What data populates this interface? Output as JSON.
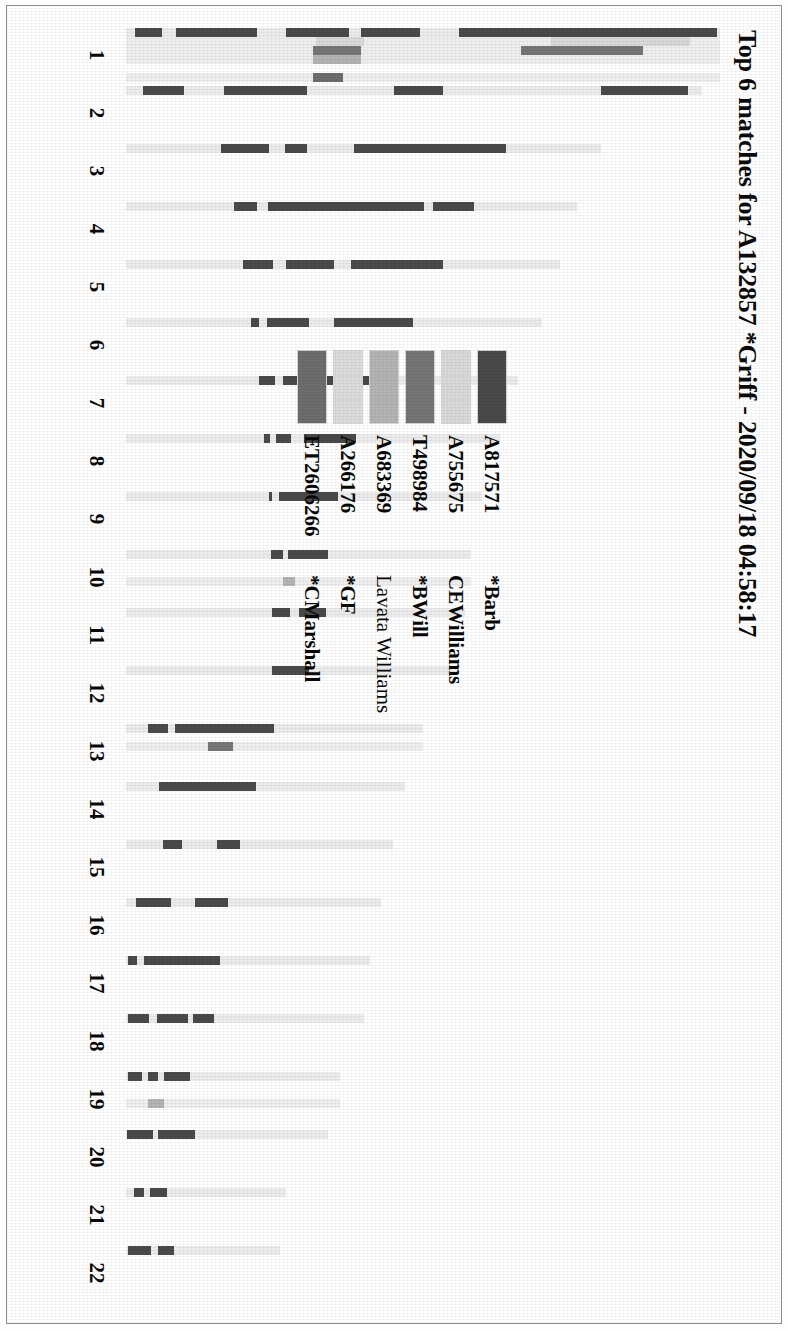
{
  "document": {
    "type": "chromosome-match-map",
    "title": "Top 6 matches for A132857 *Griff - 2020/09/18 04:58:17"
  },
  "legend": {
    "rows": [
      {
        "kit": "A817571",
        "name": "*Barb",
        "color": "#4a4a4a"
      },
      {
        "kit": "A755675",
        "name": "CEWilliams",
        "color": "#d9d9d9"
      },
      {
        "kit": "T498984",
        "name": "*BWill",
        "color": "#767676"
      },
      {
        "kit": "A683369",
        "name": "Lavata Williams",
        "color": "#b4b4b4"
      },
      {
        "kit": "A266176",
        "name": "*GF",
        "color": "#dcdcdc"
      },
      {
        "kit": "ET2606266",
        "name": "*CMarshall",
        "color": "#6d6d6d"
      }
    ]
  },
  "chart_data": {
    "type": "bar",
    "title": "Top 6 matches for A132857 *Griff - 2020/09/18 04:58:17",
    "subtitle": "",
    "xlabel": "Chromosome",
    "ylabel": "",
    "grid": false,
    "legend_position": "center",
    "orientation": "vertical-chromosome-painting",
    "categories": [
      "1",
      "2",
      "3",
      "4",
      "5",
      "6",
      "7",
      "8",
      "9",
      "10",
      "11",
      "12",
      "13",
      "14",
      "15",
      "16",
      "17",
      "18",
      "19",
      "20",
      "21",
      "22"
    ],
    "series": [
      {
        "name": "*Barb",
        "kit": "A817571",
        "color": "#4a4a4a"
      },
      {
        "name": "CEWilliams",
        "kit": "A755675",
        "color": "#d9d9d9"
      },
      {
        "name": "*BWill",
        "kit": "T498984",
        "color": "#767676"
      },
      {
        "name": "Lavata Williams",
        "kit": "A683369",
        "color": "#b4b4b4"
      },
      {
        "name": "*GF",
        "kit": "A266176",
        "color": "#dcdcdc"
      },
      {
        "name": "*CMarshall",
        "kit": "ET2606266",
        "color": "#6d6d6d"
      }
    ],
    "chromosomes": [
      {
        "name": "1",
        "length": 100,
        "lanes": [
          {
            "series": 0,
            "segments": [
              [
                0.5,
                44.0
              ],
              [
                50.5,
                60.5
              ],
              [
                62.5,
                73.0
              ],
              [
                78.0,
                91.5
              ],
              [
                94.0,
                98.5
              ]
            ]
          },
          {
            "series": 1,
            "segments": [
              [
                5.0,
                28.5
              ],
              [
                60.0,
                68.0
              ]
            ]
          },
          {
            "series": 2,
            "segments": [
              [
                13.0,
                33.5
              ],
              [
                60.5,
                68.5
              ]
            ]
          },
          {
            "series": 3,
            "segments": [
              [
                60.5,
                68.5
              ]
            ]
          },
          {
            "series": 4,
            "segments": []
          },
          {
            "series": 5,
            "segments": [
              [
                63.5,
                68.5
              ]
            ]
          }
        ]
      },
      {
        "name": "2",
        "length": 97,
        "lanes": [
          {
            "series": 0,
            "segments": [
              [
                2.5,
                17.5
              ],
              [
                45.0,
                53.5
              ],
              [
                68.5,
                83.0
              ],
              [
                90.0,
                97.0
              ]
            ]
          },
          {
            "series": 1,
            "segments": []
          },
          {
            "series": 2,
            "segments": []
          },
          {
            "series": 3,
            "segments": []
          },
          {
            "series": 4,
            "segments": []
          },
          {
            "series": 5,
            "segments": []
          }
        ]
      },
      {
        "name": "3",
        "length": 80,
        "lanes": [
          {
            "series": 0,
            "segments": [
              [
                20.0,
                52.0
              ],
              [
                62.0,
                66.5
              ],
              [
                70.0,
                80.0
              ]
            ]
          },
          {
            "series": 1,
            "segments": []
          },
          {
            "series": 2,
            "segments": []
          },
          {
            "series": 3,
            "segments": []
          },
          {
            "series": 4,
            "segments": []
          },
          {
            "series": 5,
            "segments": []
          }
        ]
      },
      {
        "name": "4",
        "length": 76,
        "lanes": [
          {
            "series": 0,
            "segments": [
              [
                23.0,
                32.0
              ],
              [
                34.0,
                68.5
              ],
              [
                71.0,
                76.0
              ]
            ]
          },
          {
            "series": 1,
            "segments": []
          },
          {
            "series": 2,
            "segments": []
          },
          {
            "series": 3,
            "segments": []
          },
          {
            "series": 4,
            "segments": []
          },
          {
            "series": 5,
            "segments": []
          }
        ]
      },
      {
        "name": "5",
        "length": 73,
        "lanes": [
          {
            "series": 0,
            "segments": [
              [
                27.0,
                48.0
              ],
              [
                52.0,
                63.0
              ],
              [
                66.0,
                73.0
              ]
            ]
          },
          {
            "series": 1,
            "segments": []
          },
          {
            "series": 2,
            "segments": []
          },
          {
            "series": 3,
            "segments": []
          },
          {
            "series": 4,
            "segments": []
          },
          {
            "series": 5,
            "segments": []
          }
        ]
      },
      {
        "name": "6",
        "length": 70,
        "lanes": [
          {
            "series": 0,
            "segments": [
              [
                31.0,
                50.0
              ],
              [
                56.0,
                66.0
              ],
              [
                68.0,
                70.0
              ]
            ]
          },
          {
            "series": 1,
            "segments": []
          },
          {
            "series": 2,
            "segments": []
          },
          {
            "series": 3,
            "segments": []
          },
          {
            "series": 4,
            "segments": []
          },
          {
            "series": 5,
            "segments": []
          }
        ]
      },
      {
        "name": "7",
        "length": 66,
        "lanes": [
          {
            "series": 0,
            "segments": [
              [
                36.5,
                60.0
              ],
              [
                62.0,
                66.0
              ]
            ]
          },
          {
            "series": 1,
            "segments": []
          },
          {
            "series": 2,
            "segments": []
          },
          {
            "series": 3,
            "segments": []
          },
          {
            "series": 4,
            "segments": []
          },
          {
            "series": 5,
            "segments": []
          }
        ]
      },
      {
        "name": "8",
        "length": 63,
        "lanes": [
          {
            "series": 0,
            "segments": [
              [
                38.5,
                52.5
              ],
              [
                56.0,
                60.0
              ],
              [
                61.5,
                63.0
              ]
            ]
          },
          {
            "series": 1,
            "segments": []
          },
          {
            "series": 2,
            "segments": []
          },
          {
            "series": 3,
            "segments": []
          },
          {
            "series": 4,
            "segments": []
          },
          {
            "series": 5,
            "segments": []
          }
        ]
      },
      {
        "name": "9",
        "length": 60,
        "lanes": [
          {
            "series": 0,
            "segments": [
              [
                40.5,
                57.0
              ],
              [
                59.0,
                60.0
              ]
            ]
          },
          {
            "series": 1,
            "segments": []
          },
          {
            "series": 2,
            "segments": []
          },
          {
            "series": 3,
            "segments": []
          },
          {
            "series": 4,
            "segments": []
          },
          {
            "series": 5,
            "segments": []
          }
        ]
      },
      {
        "name": "10",
        "length": 58,
        "lanes": [
          {
            "series": 0,
            "segments": [
              [
                41.5,
                53.0
              ],
              [
                54.5,
                58.0
              ]
            ]
          },
          {
            "series": 1,
            "segments": []
          },
          {
            "series": 2,
            "segments": []
          },
          {
            "series": 3,
            "segments": [
              [
                51.0,
                54.5
              ]
            ]
          },
          {
            "series": 4,
            "segments": []
          },
          {
            "series": 5,
            "segments": []
          }
        ]
      },
      {
        "name": "11",
        "length": 57,
        "lanes": [
          {
            "series": 0,
            "segments": [
              [
                41.0,
                49.0
              ],
              [
                51.5,
                57.0
              ]
            ]
          },
          {
            "series": 1,
            "segments": []
          },
          {
            "series": 2,
            "segments": []
          },
          {
            "series": 3,
            "segments": []
          },
          {
            "series": 4,
            "segments": []
          },
          {
            "series": 5,
            "segments": []
          }
        ]
      },
      {
        "name": "12",
        "length": 56,
        "lanes": [
          {
            "series": 0,
            "segments": [
              [
                45.0,
                56.0
              ]
            ]
          },
          {
            "series": 1,
            "segments": []
          },
          {
            "series": 2,
            "segments": []
          },
          {
            "series": 3,
            "segments": []
          },
          {
            "series": 4,
            "segments": []
          },
          {
            "series": 5,
            "segments": []
          }
        ]
      },
      {
        "name": "13",
        "length": 50,
        "lanes": [
          {
            "series": 0,
            "segments": [
              [
                50.0,
                83.5
              ],
              [
                86.0,
                92.5
              ]
            ]
          },
          {
            "series": 1,
            "segments": []
          },
          {
            "series": 2,
            "segments": [
              [
                64.0,
                72.5
              ]
            ]
          },
          {
            "series": 3,
            "segments": []
          },
          {
            "series": 4,
            "segments": []
          },
          {
            "series": 5,
            "segments": []
          }
        ]
      },
      {
        "name": "14",
        "length": 47,
        "lanes": [
          {
            "series": 0,
            "segments": [
              [
                53.5,
                88.0
              ]
            ]
          },
          {
            "series": 1,
            "segments": []
          },
          {
            "series": 2,
            "segments": []
          },
          {
            "series": 3,
            "segments": []
          },
          {
            "series": 4,
            "segments": []
          },
          {
            "series": 5,
            "segments": []
          }
        ]
      },
      {
        "name": "15",
        "length": 45,
        "lanes": [
          {
            "series": 0,
            "segments": [
              [
                57.5,
                66.0
              ],
              [
                79.0,
                86.0
              ]
            ]
          },
          {
            "series": 1,
            "segments": []
          },
          {
            "series": 2,
            "segments": []
          },
          {
            "series": 3,
            "segments": []
          },
          {
            "series": 4,
            "segments": []
          },
          {
            "series": 5,
            "segments": []
          }
        ]
      },
      {
        "name": "16",
        "length": 43,
        "lanes": [
          {
            "series": 0,
            "segments": [
              [
                60.0,
                73.0
              ],
              [
                82.5,
                96.0
              ]
            ]
          },
          {
            "series": 1,
            "segments": []
          },
          {
            "series": 2,
            "segments": []
          },
          {
            "series": 3,
            "segments": []
          },
          {
            "series": 4,
            "segments": []
          },
          {
            "series": 5,
            "segments": []
          }
        ]
      },
      {
        "name": "17",
        "length": 41,
        "lanes": [
          {
            "series": 0,
            "segments": [
              [
                61.5,
                92.5
              ],
              [
                95.5,
                99.0
              ]
            ]
          },
          {
            "series": 1,
            "segments": []
          },
          {
            "series": 2,
            "segments": []
          },
          {
            "series": 3,
            "segments": []
          },
          {
            "series": 4,
            "segments": []
          },
          {
            "series": 5,
            "segments": []
          }
        ]
      },
      {
        "name": "18",
        "length": 40,
        "lanes": [
          {
            "series": 0,
            "segments": [
              [
                63.0,
                72.0
              ],
              [
                74.0,
                87.0
              ],
              [
                90.5,
                99.0
              ]
            ]
          },
          {
            "series": 1,
            "segments": []
          },
          {
            "series": 2,
            "segments": []
          },
          {
            "series": 3,
            "segments": []
          },
          {
            "series": 4,
            "segments": []
          },
          {
            "series": 5,
            "segments": []
          }
        ]
      },
      {
        "name": "19",
        "length": 36,
        "lanes": [
          {
            "series": 0,
            "segments": [
              [
                70.0,
                82.0
              ],
              [
                85.0,
                89.5
              ],
              [
                92.5,
                99.0
              ]
            ]
          },
          {
            "series": 1,
            "segments": []
          },
          {
            "series": 2,
            "segments": []
          },
          {
            "series": 3,
            "segments": [
              [
                82.0,
                89.5
              ]
            ]
          },
          {
            "series": 4,
            "segments": []
          },
          {
            "series": 5,
            "segments": []
          }
        ]
      },
      {
        "name": "20",
        "length": 34,
        "lanes": [
          {
            "series": 0,
            "segments": [
              [
                66.0,
                84.0
              ],
              [
                86.5,
                99.5
              ]
            ]
          },
          {
            "series": 1,
            "segments": []
          },
          {
            "series": 2,
            "segments": []
          },
          {
            "series": 3,
            "segments": []
          },
          {
            "series": 4,
            "segments": []
          },
          {
            "series": 5,
            "segments": []
          }
        ]
      },
      {
        "name": "21",
        "length": 27,
        "lanes": [
          {
            "series": 0,
            "segments": [
              [
                74.5,
                85.0
              ],
              [
                88.5,
                95.0
              ]
            ]
          },
          {
            "series": 1,
            "segments": []
          },
          {
            "series": 2,
            "segments": []
          },
          {
            "series": 3,
            "segments": []
          },
          {
            "series": 4,
            "segments": []
          },
          {
            "series": 5,
            "segments": []
          }
        ]
      },
      {
        "name": "22",
        "length": 26,
        "lanes": [
          {
            "series": 0,
            "segments": [
              [
                69.0,
                79.5
              ],
              [
                83.5,
                99.0
              ]
            ]
          },
          {
            "series": 1,
            "segments": []
          },
          {
            "series": 2,
            "segments": []
          },
          {
            "series": 3,
            "segments": []
          },
          {
            "series": 4,
            "segments": []
          },
          {
            "series": 5,
            "segments": []
          }
        ]
      }
    ]
  }
}
